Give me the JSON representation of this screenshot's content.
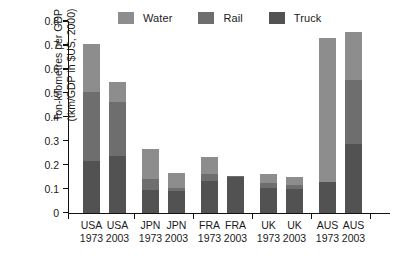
{
  "chart_data": {
    "type": "bar",
    "subtype": "stacked",
    "title": "",
    "xlabel": "",
    "ylabel": "Ton-kilometres per GDP (tkm/GDP in $US, 2000)",
    "ylabel_lines": [
      "Ton-kilometres per GDP",
      "(tkm/GDP in $US, 2000)"
    ],
    "ylim": [
      0,
      0.8
    ],
    "ytick_labels": [
      "0",
      "0.1",
      "0.2",
      "0.3",
      "0.4",
      "0.5",
      "0.6",
      "0.7",
      "0.8"
    ],
    "ytick_values": [
      0,
      0.1,
      0.2,
      0.3,
      0.4,
      0.5,
      0.6,
      0.7,
      0.8
    ],
    "grid": false,
    "legend_position": "top",
    "categories": [
      {
        "country": "USA",
        "year": "1973"
      },
      {
        "country": "USA",
        "year": "2003"
      },
      {
        "country": "JPN",
        "year": "1973"
      },
      {
        "country": "JPN",
        "year": "2003"
      },
      {
        "country": "FRA",
        "year": "1973"
      },
      {
        "country": "FRA",
        "year": "2003"
      },
      {
        "country": "UK",
        "year": "1973"
      },
      {
        "country": "UK",
        "year": "2003"
      },
      {
        "country": "AUS",
        "year": "1973"
      },
      {
        "country": "AUS",
        "year": "2003"
      }
    ],
    "category_labels": [
      "USA 1973",
      "USA 2003",
      "JPN 1973",
      "JPN 2003",
      "FRA 1973",
      "FRA 2003",
      "UK 1973",
      "UK 2003",
      "AUS 1973",
      "AUS 2003"
    ],
    "series": [
      {
        "name": "Truck",
        "color": "#525252",
        "values": [
          0.215,
          0.235,
          0.095,
          0.09,
          0.13,
          0.147,
          0.103,
          0.098,
          0.128,
          0.285
        ]
      },
      {
        "name": "Rail",
        "color": "#6e6e6e",
        "values": [
          0.29,
          0.225,
          0.047,
          0.012,
          0.033,
          0.006,
          0.022,
          0.018,
          0.0,
          0.27
        ]
      },
      {
        "name": "Water",
        "color": "#8d8d8d",
        "values": [
          0.2,
          0.085,
          0.123,
          0.063,
          0.069,
          0.002,
          0.037,
          0.032,
          0.6,
          0.198
        ]
      }
    ],
    "totals": [
      0.705,
      0.545,
      0.265,
      0.165,
      0.232,
      0.155,
      0.162,
      0.148,
      0.728,
      0.753
    ]
  },
  "legend": {
    "items": [
      {
        "label": "Water",
        "color": "#8d8d8d"
      },
      {
        "label": "Rail",
        "color": "#6e6e6e"
      },
      {
        "label": "Truck",
        "color": "#525252"
      }
    ]
  },
  "colors": {
    "axis": "#111111",
    "text": "#1a1a1a",
    "background": "#ffffff"
  }
}
